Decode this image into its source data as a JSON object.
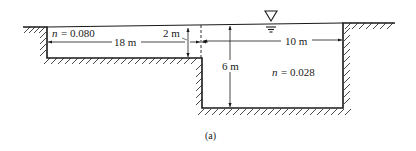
{
  "figure": {
    "caption": "(a)",
    "left_subsection": {
      "roughness_label": "n",
      "roughness_value": "= 0.080",
      "width_label": "18 m",
      "depth_label": "2 m"
    },
    "main_channel": {
      "roughness_label": "n",
      "roughness_value": "= 0.028",
      "width_label": "10 m",
      "depth_label": "6 m"
    },
    "water_surface_symbol": "free-surface-triangle"
  },
  "colors": {
    "line": "#1a1a1a",
    "background": "#ffffff"
  }
}
